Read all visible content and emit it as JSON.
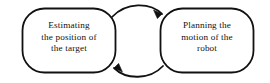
{
  "diagram": {
    "type": "cycle-flow",
    "background_color": "#ffffff",
    "stroke_color": "#111111",
    "text_color": "#111111",
    "nodes": [
      {
        "id": "estimating",
        "name": "node-estimating-position",
        "shape": "rounded-rectangle",
        "lines": [
          "Estimating",
          "the position of",
          "the target"
        ]
      },
      {
        "id": "planning",
        "name": "node-planning-motion",
        "shape": "rounded-rectangle",
        "lines": [
          "Planning the",
          "motion of the",
          "robot"
        ]
      }
    ],
    "edges": [
      {
        "id": "edge-top",
        "name": "arrow-estimating-to-planning",
        "from": "estimating",
        "to": "planning",
        "style": "curved",
        "arrowhead": "filled-triangle"
      },
      {
        "id": "edge-bottom",
        "name": "arrow-planning-to-estimating",
        "from": "planning",
        "to": "estimating",
        "style": "curved",
        "arrowhead": "filled-triangle"
      }
    ]
  }
}
